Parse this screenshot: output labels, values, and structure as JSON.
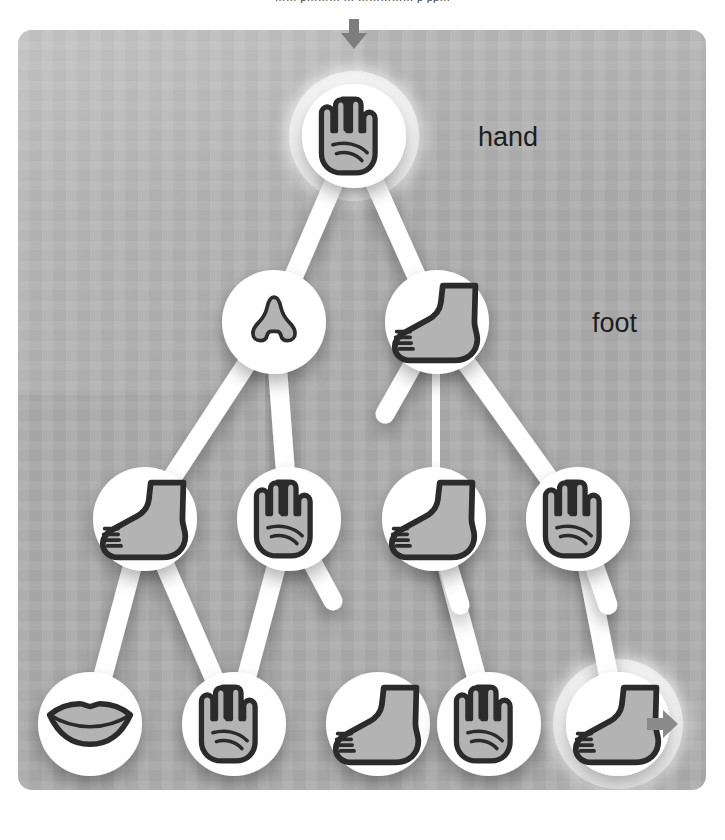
{
  "caption": {
    "text": "……  p………  …  ……………  p  pp…"
  },
  "panel": {
    "bg_color": "#ababab",
    "node_fill": "#ffffff",
    "icon_fill": "#b3b3b3",
    "icon_stroke": "#2b2b2b",
    "arrow_color": "#8a8a8a",
    "label_color": "#1d1d1d"
  },
  "labels": [
    {
      "id": "label-hand",
      "text": "hand",
      "x": 478,
      "y": 122
    },
    {
      "id": "label-foot",
      "text": "foot",
      "x": 592,
      "y": 308
    }
  ],
  "arrows": {
    "input": {
      "name": "input-arrow",
      "direction": "down",
      "x": 354,
      "y": 33
    },
    "output": {
      "name": "output-arrow",
      "direction": "right",
      "x": 665,
      "y": 724
    }
  },
  "graph": {
    "type": "node-link-tree",
    "node_radius": 52,
    "edge_width": 19,
    "nodes": [
      {
        "id": "n0",
        "row": 0,
        "icon": "hand",
        "label": "hand",
        "x": 354,
        "y": 136,
        "highlight": true
      },
      {
        "id": "n1",
        "row": 1,
        "icon": "nose",
        "label": "nose",
        "x": 274,
        "y": 322,
        "highlight": false
      },
      {
        "id": "n2",
        "row": 1,
        "icon": "foot",
        "label": "foot",
        "x": 437,
        "y": 322,
        "highlight": false
      },
      {
        "id": "n3",
        "row": 2,
        "icon": "foot",
        "label": "foot",
        "x": 145,
        "y": 519,
        "highlight": false
      },
      {
        "id": "n4",
        "row": 2,
        "icon": "hand",
        "label": "hand",
        "x": 289,
        "y": 519,
        "highlight": false
      },
      {
        "id": "n5",
        "row": 2,
        "icon": "foot",
        "label": "foot",
        "x": 434,
        "y": 519,
        "highlight": false
      },
      {
        "id": "n6",
        "row": 2,
        "icon": "hand",
        "label": "hand",
        "x": 578,
        "y": 519,
        "highlight": false
      },
      {
        "id": "n7",
        "row": 3,
        "icon": "mouth",
        "label": "mouth",
        "x": 90,
        "y": 724,
        "highlight": false
      },
      {
        "id": "n8",
        "row": 3,
        "icon": "hand",
        "label": "hand",
        "x": 234,
        "y": 724,
        "highlight": false
      },
      {
        "id": "n9",
        "row": 3,
        "icon": "foot",
        "label": "foot",
        "x": 378,
        "y": 724,
        "highlight": false
      },
      {
        "id": "n10",
        "row": 3,
        "icon": "hand",
        "label": "hand",
        "x": 489,
        "y": 724,
        "highlight": false
      },
      {
        "id": "n11",
        "row": 3,
        "icon": "foot",
        "label": "foot",
        "x": 618,
        "y": 724,
        "highlight": true
      }
    ],
    "edges": [
      {
        "from": "n0",
        "to": "n1"
      },
      {
        "from": "n0",
        "to": "n2"
      },
      {
        "from": "n1",
        "to": "n2"
      },
      {
        "from": "n1",
        "to": "n3"
      },
      {
        "from": "n1",
        "to": "n4"
      },
      {
        "from": "n2",
        "to": "n5"
      },
      {
        "from": "n2",
        "to": "n6"
      },
      {
        "from": "n3",
        "to": "n4"
      },
      {
        "from": "n4",
        "to": "n5"
      },
      {
        "from": "n5",
        "to": "n6"
      },
      {
        "from": "n3",
        "to": "n7"
      },
      {
        "from": "n3",
        "to": "n8"
      },
      {
        "from": "n4",
        "to": "n8"
      },
      {
        "from": "n5",
        "to": "n10"
      },
      {
        "from": "n6",
        "to": "n11"
      },
      {
        "from": "n7",
        "to": "n8"
      },
      {
        "from": "n8",
        "to": "n9"
      },
      {
        "from": "n9",
        "to": "n10"
      },
      {
        "from": "n10",
        "to": "n11"
      }
    ],
    "stubs": [
      {
        "from": "n2",
        "dx": -52,
        "dy": 92
      },
      {
        "from": "n4",
        "dx": 44,
        "dy": 82
      },
      {
        "from": "n5",
        "dx": 26,
        "dy": 86
      },
      {
        "from": "n6",
        "dx": 30,
        "dy": 86
      }
    ]
  }
}
